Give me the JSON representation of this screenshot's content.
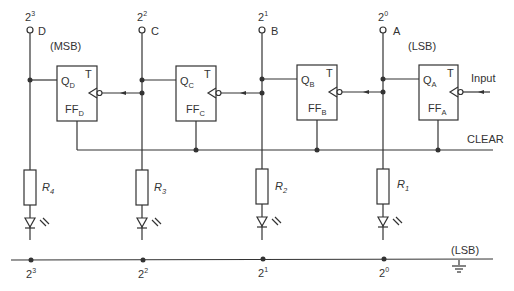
{
  "diagram": {
    "outputs": [
      {
        "weight_base": "2",
        "weight_exp": "3",
        "name": "D",
        "note": "(MSB)",
        "x": 30
      },
      {
        "weight_base": "2",
        "weight_exp": "2",
        "name": "C",
        "note": "",
        "x": 142
      },
      {
        "weight_base": "2",
        "weight_exp": "1",
        "name": "B",
        "note": "",
        "x": 262
      },
      {
        "weight_base": "2",
        "weight_exp": "0",
        "name": "A",
        "note": "(LSB)",
        "x": 383
      }
    ],
    "flip_flops": [
      {
        "q_main": "Q",
        "q_sub": "D",
        "ff_main": "FF",
        "ff_sub": "D",
        "t": "T"
      },
      {
        "q_main": "Q",
        "q_sub": "C",
        "ff_main": "FF",
        "ff_sub": "C",
        "t": "T"
      },
      {
        "q_main": "Q",
        "q_sub": "B",
        "ff_main": "FF",
        "ff_sub": "B",
        "t": "T"
      },
      {
        "q_main": "Q",
        "q_sub": "A",
        "ff_main": "FF",
        "ff_sub": "A",
        "t": "T"
      }
    ],
    "resistors": [
      {
        "main": "R",
        "sub": "4"
      },
      {
        "main": "R",
        "sub": "3"
      },
      {
        "main": "R",
        "sub": "2"
      },
      {
        "main": "R",
        "sub": "1"
      }
    ],
    "bottom_labels": [
      {
        "base": "2",
        "exp": "3"
      },
      {
        "base": "2",
        "exp": "2"
      },
      {
        "base": "2",
        "exp": "1"
      },
      {
        "base": "2",
        "exp": "0"
      }
    ],
    "input_label": "Input",
    "clear_label": "CLEAR",
    "ground_note": "(LSB)",
    "msb_note": "(MSB)",
    "lsb_note": "(LSB)"
  }
}
